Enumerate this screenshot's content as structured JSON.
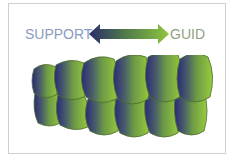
{
  "diagram": {
    "left_label": "SUPPORT",
    "right_label": "GUID",
    "arrow": {
      "type": "double-headed",
      "gradient_start": "#2b2c6b",
      "gradient_end": "#8dc63f"
    },
    "teeth": {
      "upper_count": 6,
      "lower_count": 6,
      "gradient_start": "#2a2a78",
      "gradient_end": "#94c93d",
      "outline_color": "#4d6b2a"
    },
    "colors": {
      "frame_border": "#cfcfcf",
      "left_label_color": "#8a9bbd",
      "right_label_color": "#8fa27e"
    }
  }
}
